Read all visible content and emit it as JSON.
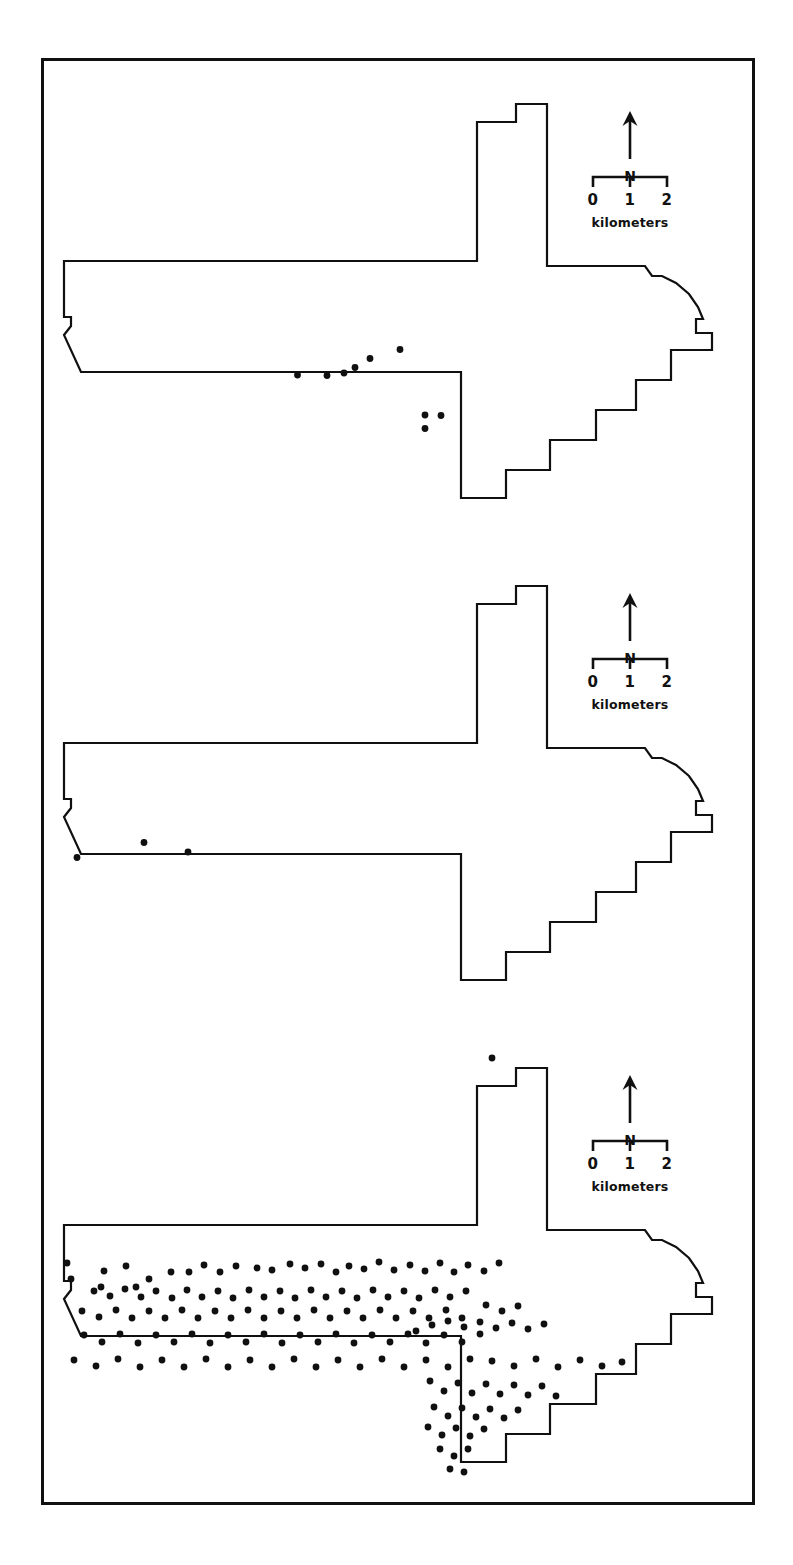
{
  "figure": {
    "domain": "map",
    "background_color": "#ffffff",
    "ink_color": "#101010",
    "frame": {
      "border_width": 3,
      "x": 41,
      "y": 58,
      "width": 714,
      "height": 1447
    }
  },
  "legend": {
    "north_label": "N",
    "north_arrow_icon": "north-arrow-icon",
    "scale_ticks": [
      "0",
      "1",
      "2"
    ],
    "scale_units": "kilometers"
  },
  "panels": [
    {
      "id": "panel-1",
      "index": 1,
      "point_count": 9,
      "points": [
        [
          253.5,
          314.0
        ],
        [
          283.0,
          314.5
        ],
        [
          311.0,
          306.5
        ],
        [
          326.0,
          297.5
        ],
        [
          356.0,
          288.5
        ],
        [
          381.0,
          354.0
        ],
        [
          381.0,
          367.5
        ],
        [
          397.0,
          354.5
        ],
        [
          300.0,
          312.0
        ]
      ]
    },
    {
      "id": "panel-2",
      "index": 2,
      "point_count": 3,
      "points": [
        [
          33.0,
          314.5
        ],
        [
          100.0,
          299.5
        ],
        [
          144.0,
          309.0
        ]
      ]
    },
    {
      "id": "panel-3",
      "index": 3,
      "point_count": 168,
      "points": [
        [
          448.0,
          33.0
        ],
        [
          23.0,
          238.0
        ],
        [
          27.0,
          254.0
        ],
        [
          60.0,
          246.0
        ],
        [
          82.0,
          241.0
        ],
        [
          57.0,
          262.0
        ],
        [
          92.0,
          262.0
        ],
        [
          105.0,
          254.0
        ],
        [
          127.0,
          247.0
        ],
        [
          145.0,
          247.0
        ],
        [
          160.0,
          240.0
        ],
        [
          176.0,
          247.0
        ],
        [
          192.0,
          241.0
        ],
        [
          213.0,
          243.0
        ],
        [
          228.0,
          245.0
        ],
        [
          246.0,
          239.0
        ],
        [
          261.0,
          243.0
        ],
        [
          277.0,
          239.0
        ],
        [
          292.0,
          247.0
        ],
        [
          305.0,
          241.0
        ],
        [
          320.0,
          244.0
        ],
        [
          335.0,
          237.0
        ],
        [
          350.0,
          245.0
        ],
        [
          366.0,
          240.0
        ],
        [
          381.0,
          246.0
        ],
        [
          396.0,
          238.0
        ],
        [
          410.0,
          247.0
        ],
        [
          424.0,
          240.0
        ],
        [
          440.0,
          246.0
        ],
        [
          455.0,
          238.0
        ],
        [
          50.0,
          266.0
        ],
        [
          66.0,
          271.0
        ],
        [
          81.0,
          264.0
        ],
        [
          97.0,
          272.0
        ],
        [
          112.0,
          266.0
        ],
        [
          128.0,
          273.0
        ],
        [
          143.0,
          265.0
        ],
        [
          158.0,
          272.0
        ],
        [
          174.0,
          266.0
        ],
        [
          189.0,
          273.0
        ],
        [
          205.0,
          265.0
        ],
        [
          220.0,
          272.0
        ],
        [
          236.0,
          266.0
        ],
        [
          251.0,
          273.0
        ],
        [
          267.0,
          265.0
        ],
        [
          282.0,
          272.0
        ],
        [
          298.0,
          266.0
        ],
        [
          313.0,
          273.0
        ],
        [
          329.0,
          265.0
        ],
        [
          344.0,
          272.0
        ],
        [
          360.0,
          266.0
        ],
        [
          375.0,
          273.0
        ],
        [
          391.0,
          265.0
        ],
        [
          406.0,
          272.0
        ],
        [
          422.0,
          266.0
        ],
        [
          38.0,
          286.0
        ],
        [
          55.0,
          292.0
        ],
        [
          72.0,
          285.0
        ],
        [
          88.0,
          293.0
        ],
        [
          105.0,
          286.0
        ],
        [
          121.0,
          293.0
        ],
        [
          138.0,
          285.0
        ],
        [
          154.0,
          293.0
        ],
        [
          171.0,
          286.0
        ],
        [
          187.0,
          293.0
        ],
        [
          204.0,
          285.0
        ],
        [
          220.0,
          293.0
        ],
        [
          237.0,
          286.0
        ],
        [
          253.0,
          293.0
        ],
        [
          270.0,
          285.0
        ],
        [
          286.0,
          293.0
        ],
        [
          303.0,
          286.0
        ],
        [
          319.0,
          293.0
        ],
        [
          336.0,
          285.0
        ],
        [
          352.0,
          293.0
        ],
        [
          369.0,
          286.0
        ],
        [
          385.0,
          293.0
        ],
        [
          402.0,
          285.0
        ],
        [
          418.0,
          293.0
        ],
        [
          40.0,
          310.0
        ],
        [
          58.0,
          317.0
        ],
        [
          76.0,
          309.0
        ],
        [
          94.0,
          318.0
        ],
        [
          112.0,
          310.0
        ],
        [
          130.0,
          317.0
        ],
        [
          148.0,
          309.0
        ],
        [
          166.0,
          318.0
        ],
        [
          184.0,
          310.0
        ],
        [
          202.0,
          317.0
        ],
        [
          220.0,
          309.0
        ],
        [
          238.0,
          318.0
        ],
        [
          256.0,
          310.0
        ],
        [
          274.0,
          317.0
        ],
        [
          292.0,
          309.0
        ],
        [
          310.0,
          318.0
        ],
        [
          328.0,
          310.0
        ],
        [
          346.0,
          317.0
        ],
        [
          364.0,
          309.0
        ],
        [
          382.0,
          318.0
        ],
        [
          400.0,
          310.0
        ],
        [
          418.0,
          317.0
        ],
        [
          436.0,
          309.0
        ],
        [
          30.0,
          335.0
        ],
        [
          52.0,
          341.0
        ],
        [
          74.0,
          334.0
        ],
        [
          96.0,
          342.0
        ],
        [
          118.0,
          335.0
        ],
        [
          140.0,
          342.0
        ],
        [
          162.0,
          334.0
        ],
        [
          184.0,
          342.0
        ],
        [
          206.0,
          335.0
        ],
        [
          228.0,
          342.0
        ],
        [
          250.0,
          334.0
        ],
        [
          272.0,
          342.0
        ],
        [
          294.0,
          335.0
        ],
        [
          316.0,
          342.0
        ],
        [
          338.0,
          334.0
        ],
        [
          360.0,
          342.0
        ],
        [
          382.0,
          335.0
        ],
        [
          404.0,
          342.0
        ],
        [
          426.0,
          334.0
        ],
        [
          448.0,
          336.0
        ],
        [
          470.0,
          341.0
        ],
        [
          492.0,
          334.0
        ],
        [
          514.0,
          342.0
        ],
        [
          536.0,
          335.0
        ],
        [
          558.0,
          341.0
        ],
        [
          578.0,
          337.0
        ],
        [
          372.0,
          306.0
        ],
        [
          388.0,
          300.0
        ],
        [
          404.0,
          296.0
        ],
        [
          420.0,
          302.0
        ],
        [
          436.0,
          297.0
        ],
        [
          452.0,
          303.0
        ],
        [
          468.0,
          298.0
        ],
        [
          484.0,
          304.0
        ],
        [
          500.0,
          299.0
        ],
        [
          386.0,
          356.0
        ],
        [
          400.0,
          366.0
        ],
        [
          414.0,
          358.0
        ],
        [
          428.0,
          368.0
        ],
        [
          442.0,
          359.0
        ],
        [
          456.0,
          369.0
        ],
        [
          470.0,
          360.0
        ],
        [
          484.0,
          370.0
        ],
        [
          498.0,
          361.0
        ],
        [
          512.0,
          371.0
        ],
        [
          390.0,
          382.0
        ],
        [
          404.0,
          391.0
        ],
        [
          418.0,
          383.0
        ],
        [
          432.0,
          392.0
        ],
        [
          446.0,
          384.0
        ],
        [
          460.0,
          393.0
        ],
        [
          474.0,
          385.0
        ],
        [
          384.0,
          402.0
        ],
        [
          398.0,
          410.0
        ],
        [
          412.0,
          403.0
        ],
        [
          426.0,
          411.0
        ],
        [
          440.0,
          404.0
        ],
        [
          396.0,
          424.0
        ],
        [
          410.0,
          431.0
        ],
        [
          424.0,
          424.0
        ],
        [
          406.0,
          444.0
        ],
        [
          420.0,
          447.0
        ],
        [
          442.0,
          280.0
        ],
        [
          458.0,
          286.0
        ],
        [
          474.0,
          281.0
        ]
      ]
    }
  ]
}
